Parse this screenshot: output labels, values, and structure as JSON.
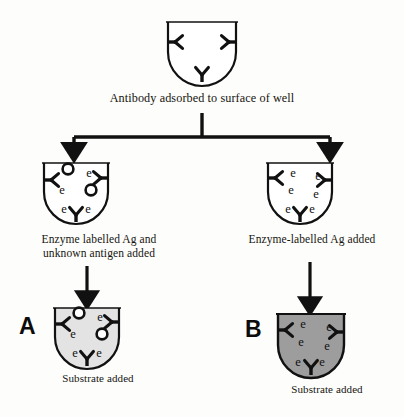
{
  "steps": {
    "top_caption": "Antibody adsorbed to surface of well",
    "left_caption": "Enzyme labelled Ag and\nunknown antigen added",
    "right_caption": "Enzyme-labelled Ag added",
    "left_bottom_caption": "Substrate added",
    "right_bottom_caption": "Substrate added"
  },
  "panels": {
    "left_letter": "A",
    "right_letter": "B"
  },
  "glyphs": {
    "enzyme_label": "e",
    "antibody": "Y-antibody",
    "antigen": "open-circle-antigen"
  },
  "colors": {
    "ink": "#111111",
    "outline": "#111111",
    "well_empty_fill": "#ffffff",
    "well_light_fill": "#e3e3e3",
    "well_dark_fill": "#9d9d9d",
    "page_background": "#fdfdfb"
  },
  "wells": [
    {
      "id": "well-top",
      "fill": "empty",
      "antibodies": 3,
      "enzyme_labels": 0,
      "antigens": 0
    },
    {
      "id": "well-left-middle",
      "fill": "empty",
      "antibodies": 3,
      "enzyme_labels": 4,
      "antigens": 2
    },
    {
      "id": "well-right-middle",
      "fill": "empty",
      "antibodies": 3,
      "enzyme_labels": 6,
      "antigens": 0
    },
    {
      "id": "well-left-bottom",
      "fill": "light",
      "antibodies": 3,
      "enzyme_labels": 4,
      "antigens": 2
    },
    {
      "id": "well-right-bottom",
      "fill": "dark",
      "antibodies": 3,
      "enzyme_labels": 6,
      "antigens": 0
    }
  ],
  "connectors": {
    "split_arrow": "T-split down to two wells",
    "left_arrow": "down-arrow",
    "right_arrow": "down-arrow"
  }
}
